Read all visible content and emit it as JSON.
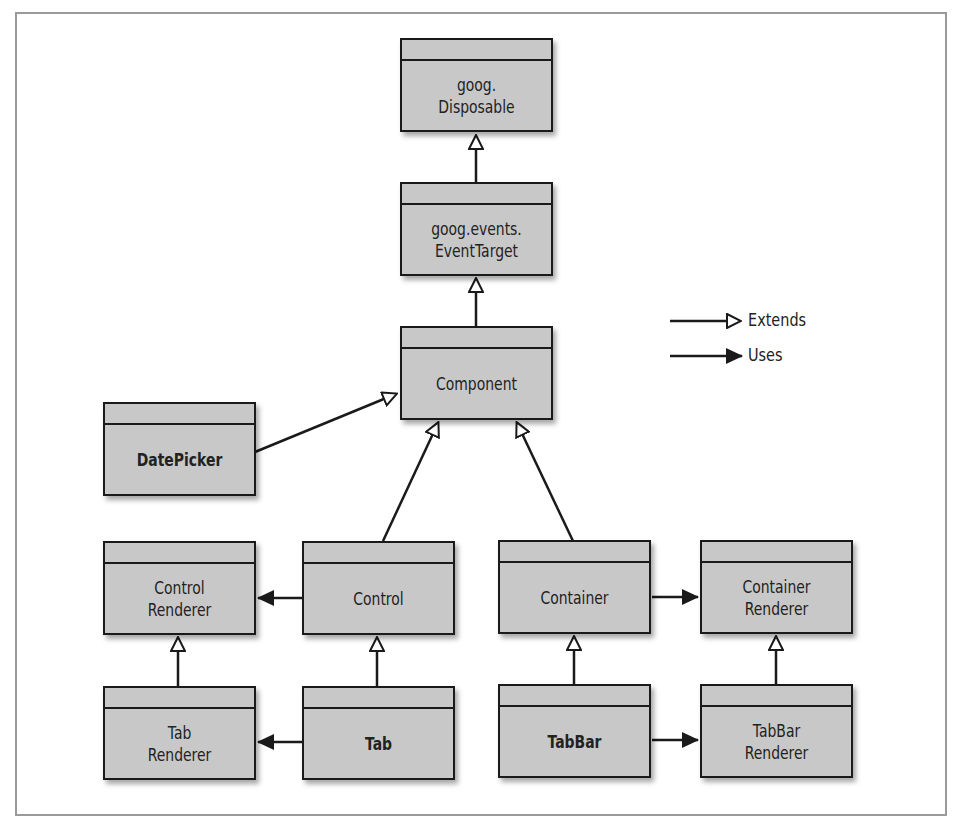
{
  "diagram": {
    "type": "uml-class-hierarchy",
    "classes": [
      {
        "id": "disposable",
        "label": "goog.\nDisposable",
        "bold": false
      },
      {
        "id": "eventtarget",
        "label": "goog.events.\nEventTarget",
        "bold": false
      },
      {
        "id": "component",
        "label": "Component",
        "bold": false
      },
      {
        "id": "datepicker",
        "label": "DatePicker",
        "bold": true
      },
      {
        "id": "controlrenderer",
        "label": "Control\nRenderer",
        "bold": false
      },
      {
        "id": "control",
        "label": "Control",
        "bold": false
      },
      {
        "id": "container",
        "label": "Container",
        "bold": false
      },
      {
        "id": "containerrenderer",
        "label": "Container\nRenderer",
        "bold": false
      },
      {
        "id": "tabrenderer",
        "label": "Tab\nRenderer",
        "bold": false
      },
      {
        "id": "tab",
        "label": "Tab",
        "bold": true
      },
      {
        "id": "tabbar",
        "label": "TabBar",
        "bold": true
      },
      {
        "id": "tabbarrenderer",
        "label": "TabBar\nRenderer",
        "bold": false
      }
    ],
    "relations": [
      {
        "from": "eventtarget",
        "to": "disposable",
        "kind": "extends"
      },
      {
        "from": "component",
        "to": "eventtarget",
        "kind": "extends"
      },
      {
        "from": "datepicker",
        "to": "component",
        "kind": "extends"
      },
      {
        "from": "control",
        "to": "component",
        "kind": "extends"
      },
      {
        "from": "container",
        "to": "component",
        "kind": "extends"
      },
      {
        "from": "control",
        "to": "controlrenderer",
        "kind": "uses"
      },
      {
        "from": "container",
        "to": "containerrenderer",
        "kind": "uses"
      },
      {
        "from": "tabrenderer",
        "to": "controlrenderer",
        "kind": "extends"
      },
      {
        "from": "tab",
        "to": "control",
        "kind": "extends"
      },
      {
        "from": "tabbar",
        "to": "container",
        "kind": "extends"
      },
      {
        "from": "tabbarrenderer",
        "to": "containerrenderer",
        "kind": "extends"
      },
      {
        "from": "tab",
        "to": "tabrenderer",
        "kind": "uses"
      },
      {
        "from": "tabbar",
        "to": "tabbarrenderer",
        "kind": "uses"
      }
    ]
  },
  "legend": {
    "extends_label": "Extends",
    "uses_label": "Uses"
  },
  "colors": {
    "box_fill": "#c8c8c8",
    "stroke": "#1a1a1a",
    "frame": "#9a9a9a"
  }
}
